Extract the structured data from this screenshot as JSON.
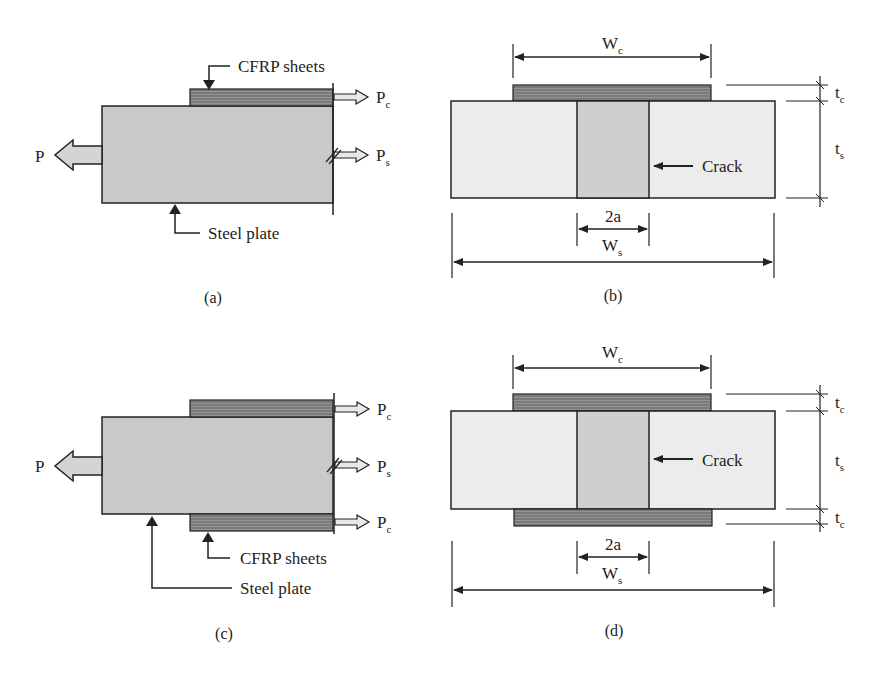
{
  "colors": {
    "steel_side": "#c9c9c9",
    "steel_section": "#ececec",
    "crack": "#cfcfcf",
    "cfrp": "#7a7a7a",
    "arrow_fill": "#d4d4d4",
    "line": "#222222"
  },
  "panels": [
    {
      "id": "a",
      "caption": "(a)",
      "labels": {
        "cfrp": "CFRP sheets",
        "steel": "Steel plate",
        "load": "P",
        "pc_main": "P",
        "pc_sub": "c",
        "ps_main": "P",
        "ps_sub": "s"
      }
    },
    {
      "id": "b",
      "caption": "(b)",
      "labels": {
        "wc_main": "W",
        "wc_sub": "c",
        "tc_main": "t",
        "tc_sub": "c",
        "ts_main": "t",
        "ts_sub": "s",
        "crack": "Crack",
        "crack_width": "2a",
        "ws_main": "W",
        "ws_sub": "s"
      }
    },
    {
      "id": "c",
      "caption": "(c)",
      "labels": {
        "cfrp": "CFRP sheets",
        "steel": "Steel plate",
        "load": "P",
        "pc_main": "P",
        "pc_sub": "c",
        "ps_main": "P",
        "ps_sub": "s",
        "pc2_main": "P",
        "pc2_sub": "c"
      }
    },
    {
      "id": "d",
      "caption": "(d)",
      "labels": {
        "wc_main": "W",
        "wc_sub": "c",
        "tc_main": "t",
        "tc_sub": "c",
        "ts_main": "t",
        "ts_sub": "s",
        "tc2_main": "t",
        "tc2_sub": "c",
        "crack": "Crack",
        "crack_width": "2a",
        "ws_main": "W",
        "ws_sub": "s"
      }
    }
  ]
}
